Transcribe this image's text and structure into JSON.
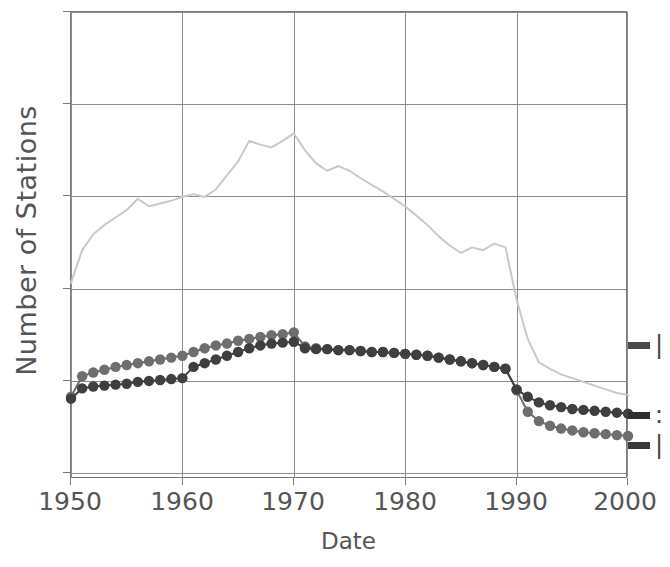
{
  "chart_data": {
    "type": "line",
    "title": "",
    "subtitle": "",
    "xlabel": "Date",
    "ylabel": "Number of Stations",
    "xlim": [
      1950,
      2000
    ],
    "ylim": [
      0,
      5
    ],
    "xticks": [
      1950,
      1960,
      1970,
      1980,
      1990,
      2000
    ],
    "xticklabels": [
      "1950",
      "1960",
      "1970",
      "1980",
      "1990",
      "2000"
    ],
    "yticks": [
      0,
      1,
      2,
      3,
      4,
      5
    ],
    "yticklabels": [
      "",
      "",
      "",
      "",
      "",
      ""
    ],
    "grid": true,
    "legend_position": "right-outside-clipped",
    "x": [
      1950,
      1951,
      1952,
      1953,
      1954,
      1955,
      1956,
      1957,
      1958,
      1959,
      1960,
      1961,
      1962,
      1963,
      1964,
      1965,
      1966,
      1967,
      1968,
      1969,
      1970,
      1971,
      1972,
      1973,
      1974,
      1975,
      1976,
      1977,
      1978,
      1979,
      1980,
      1981,
      1982,
      1983,
      1984,
      1985,
      1986,
      1987,
      1988,
      1989,
      1990,
      1991,
      1992,
      1993,
      1994,
      1995,
      1996,
      1997,
      1998,
      1999,
      2000
    ],
    "series": [
      {
        "name": "light-gray-series",
        "color": "#c9c9c9",
        "marker": "none",
        "linewidth": 2,
        "values": [
          2.1,
          2.45,
          2.62,
          2.72,
          2.8,
          2.88,
          3.0,
          2.92,
          2.95,
          2.98,
          3.02,
          3.05,
          3.02,
          3.1,
          3.25,
          3.4,
          3.62,
          3.58,
          3.55,
          3.62,
          3.7,
          3.52,
          3.38,
          3.3,
          3.35,
          3.3,
          3.22,
          3.15,
          3.08,
          3.0,
          2.92,
          2.82,
          2.72,
          2.6,
          2.5,
          2.42,
          2.48,
          2.45,
          2.52,
          2.48,
          1.92,
          1.5,
          1.25,
          1.18,
          1.12,
          1.08,
          1.04,
          1.0,
          0.96,
          0.92,
          0.9
        ]
      },
      {
        "name": "medium-gray-series",
        "color": "#6e6e6e",
        "marker": "circle",
        "linewidth": 2,
        "values": [
          0.88,
          1.1,
          1.14,
          1.17,
          1.2,
          1.22,
          1.24,
          1.26,
          1.28,
          1.3,
          1.32,
          1.36,
          1.4,
          1.43,
          1.45,
          1.48,
          1.5,
          1.52,
          1.54,
          1.55,
          1.57,
          1.42,
          1.4,
          1.39,
          1.38,
          1.38,
          1.37,
          1.36,
          1.36,
          1.35,
          1.34,
          1.33,
          1.32,
          1.3,
          1.28,
          1.26,
          1.24,
          1.22,
          1.2,
          1.18,
          0.95,
          0.72,
          0.62,
          0.57,
          0.54,
          0.52,
          0.5,
          0.49,
          0.48,
          0.47,
          0.46
        ]
      },
      {
        "name": "dark-gray-series",
        "color": "#3f3f3f",
        "marker": "circle",
        "linewidth": 2,
        "values": [
          0.86,
          0.97,
          0.99,
          1.0,
          1.01,
          1.02,
          1.04,
          1.05,
          1.06,
          1.07,
          1.08,
          1.2,
          1.24,
          1.28,
          1.32,
          1.36,
          1.4,
          1.43,
          1.45,
          1.46,
          1.47,
          1.4,
          1.39,
          1.39,
          1.38,
          1.38,
          1.37,
          1.36,
          1.36,
          1.35,
          1.34,
          1.33,
          1.32,
          1.3,
          1.28,
          1.26,
          1.24,
          1.22,
          1.2,
          1.18,
          0.96,
          0.88,
          0.82,
          0.79,
          0.77,
          0.75,
          0.74,
          0.73,
          0.72,
          0.71,
          0.7
        ]
      }
    ],
    "legend": [
      {
        "label": "|",
        "color": "#555555",
        "series": "light-gray-series"
      },
      {
        "label": ":",
        "color": "#555555",
        "series": "dark-gray-series"
      },
      {
        "label": "|",
        "color": "#555555",
        "series": "medium-gray-series"
      }
    ]
  },
  "axes": {
    "ylabel": "Number of Stations",
    "xlabel": "Date",
    "xticklabels": [
      "1950",
      "1960",
      "1970",
      "1980",
      "1990",
      "2000"
    ]
  },
  "colors": {
    "light_series": "#c9c9c9",
    "medium_series": "#6e6e6e",
    "dark_series": "#3f3f3f",
    "grid": "#8d8d8d",
    "frame": "#7a7a7a",
    "text": "#555555",
    "background": "#ffffff"
  }
}
